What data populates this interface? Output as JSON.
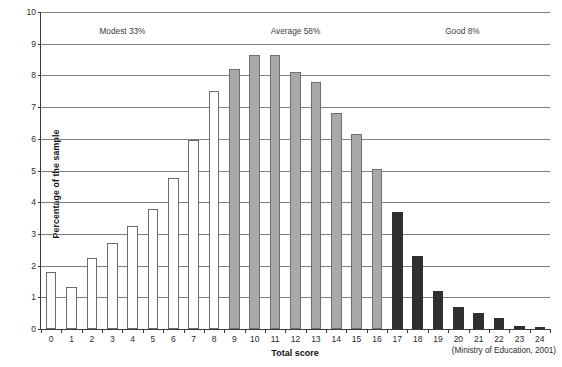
{
  "chart_data": {
    "type": "bar",
    "title": "",
    "xlabel": "Total score",
    "ylabel": "Percentage of the sample",
    "ylim": [
      0,
      10
    ],
    "ytick_step": 1,
    "grid": true,
    "legend": "none",
    "categories": [
      "0",
      "1",
      "2",
      "3",
      "4",
      "5",
      "6",
      "7",
      "8",
      "9",
      "10",
      "11",
      "12",
      "13",
      "14",
      "15",
      "16",
      "17",
      "18",
      "19",
      "20",
      "21",
      "22",
      "23",
      "24"
    ],
    "values": [
      1.8,
      1.33,
      2.25,
      2.7,
      3.25,
      3.78,
      4.75,
      5.95,
      7.5,
      8.2,
      8.65,
      8.65,
      8.1,
      7.8,
      6.8,
      6.15,
      5.05,
      3.68,
      2.3,
      1.2,
      0.7,
      0.5,
      0.35,
      0.1,
      0.07
    ],
    "groups": [
      {
        "name": "Modest",
        "fill": "white",
        "from": "0",
        "to": "8"
      },
      {
        "name": "Average",
        "fill": "gray",
        "from": "9",
        "to": "16"
      },
      {
        "name": "Good",
        "fill": "black",
        "from": "17",
        "to": "24"
      }
    ],
    "ytick_labels": [
      "0",
      "1",
      "2",
      "3",
      "4",
      "5",
      "6",
      "7",
      "8",
      "9",
      "10"
    ],
    "annotations": [
      {
        "text": "Modest 33%",
        "x": "3.5"
      },
      {
        "text": "Average 58%",
        "x": "12"
      },
      {
        "text": "Good 8%",
        "x": "20.2"
      }
    ],
    "source": "(Ministry of Education, 2001)"
  },
  "colors": {
    "modest": "#ffffff",
    "average": "#a9a9a9",
    "good": "#2f2f2f",
    "axis": "#3a3a3a",
    "grid": "#7f7f7f",
    "text": "#1a1a1a"
  }
}
